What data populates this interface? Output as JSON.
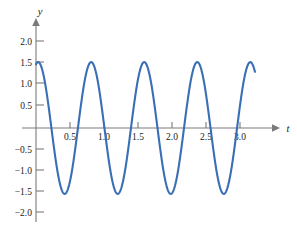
{
  "chart_data": {
    "type": "line",
    "title": "",
    "xlabel": "t",
    "ylabel": "y",
    "grid": false,
    "legend": false,
    "xlim": [
      0,
      3.3
    ],
    "ylim": [
      -2.15,
      2.15
    ],
    "x_ticks": [
      0.5,
      1.0,
      1.5,
      2.0,
      2.5,
      3.0
    ],
    "x_tick_labels": [
      "0.5",
      "1.0",
      "1.5",
      "2.0",
      "2.5",
      "3.0"
    ],
    "y_ticks": [
      2.0,
      1.5,
      1.0,
      0.5,
      -0.5,
      -1.0,
      -1.5,
      -2.0
    ],
    "y_tick_labels": [
      "2.0",
      "1.5",
      "1.0",
      "0.5",
      "−0.5",
      "−1.0",
      "−1.5",
      "−2.0"
    ],
    "curve_color": "#3a6fb5",
    "axis_color": "#7a7a7a",
    "series": [
      {
        "name": "damped-free oscillation",
        "description": "sinusoid of amplitude 1.55 and period 0.78 beginning at y = 1.5 when t = 0",
        "amplitude": 1.55,
        "period": 0.78,
        "phase_y_at_zero": 1.5,
        "t_start": 0.0,
        "t_end": 3.22,
        "peaks_t": [
          0.75,
          1.53,
          2.31,
          3.09
        ],
        "peaks_y": [
          1.55,
          1.55,
          1.55,
          1.55
        ],
        "troughs_t": [
          0.36,
          1.14,
          1.92,
          2.7
        ],
        "troughs_y": [
          -1.55,
          -1.55,
          -1.55,
          -1.55
        ],
        "zeros_t": [
          0.25,
          0.49,
          1.03,
          1.27,
          1.81,
          2.05,
          2.59,
          2.83
        ],
        "x": [
          0.0,
          0.05,
          0.1,
          0.15,
          0.2,
          0.25,
          0.3,
          0.36,
          0.42,
          0.48,
          0.55,
          0.62,
          0.68,
          0.75,
          0.82,
          0.89,
          0.96,
          1.03,
          1.09,
          1.14,
          1.2,
          1.27,
          1.34,
          1.41,
          1.47,
          1.53,
          1.6,
          1.67,
          1.74,
          1.81,
          1.87,
          1.92,
          1.98,
          2.05,
          2.12,
          2.19,
          2.25,
          2.31,
          2.38,
          2.45,
          2.52,
          2.59,
          2.65,
          2.7,
          2.76,
          2.83,
          2.9,
          2.97,
          3.03,
          3.09,
          3.16,
          3.22
        ],
        "y": [
          1.5,
          1.3,
          1.02,
          0.67,
          0.27,
          -0.15,
          -0.7,
          -1.55,
          -1.44,
          -1.1,
          -0.45,
          0.35,
          0.95,
          1.55,
          1.4,
          1.0,
          0.43,
          -0.2,
          -0.8,
          -1.55,
          -1.48,
          -1.18,
          -0.55,
          0.25,
          0.9,
          1.55,
          1.45,
          1.08,
          0.5,
          -0.15,
          -0.75,
          -1.55,
          -1.5,
          -1.22,
          -0.6,
          0.18,
          0.85,
          1.55,
          1.47,
          1.12,
          0.55,
          -0.1,
          -0.7,
          -1.55,
          -1.52,
          -1.25,
          -0.65,
          0.12,
          0.8,
          1.55,
          1.22,
          0.8
        ]
      }
    ]
  },
  "axes": {
    "y_axis_label": "y",
    "x_axis_label": "t"
  }
}
